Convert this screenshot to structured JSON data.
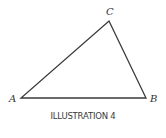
{
  "figure": {
    "vertices": {
      "A": {
        "label": "A",
        "x": 21,
        "y": 98
      },
      "B": {
        "label": "B",
        "x": 146,
        "y": 98
      },
      "C": {
        "label": "C",
        "x": 109,
        "y": 21
      }
    },
    "stroke_color": "#3a3a3a",
    "caption": "ILLUSTRATION 4"
  }
}
